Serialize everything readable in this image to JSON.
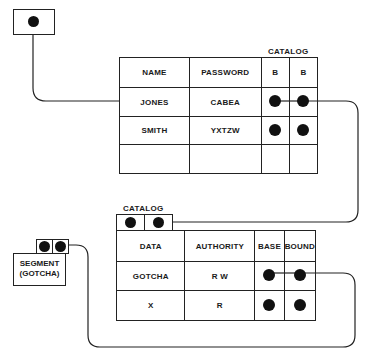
{
  "top_pointer": {
    "icon": "pointer-dot-icon"
  },
  "user_table": {
    "catalog_label": "CATALOG",
    "headers": [
      "NAME",
      "PASSWORD",
      "B",
      "B"
    ],
    "rows": [
      {
        "name": "JONES",
        "password": "CABEA",
        "b1": "dot",
        "b2": "dot"
      },
      {
        "name": "SMITH",
        "password": "YXTZW",
        "b1": "dot",
        "b2": "dot"
      },
      {
        "name": "",
        "password": "",
        "b1": "",
        "b2": ""
      }
    ]
  },
  "catalog_table": {
    "catalog_label": "CATALOG",
    "headers": [
      "DATA",
      "AUTHORITY",
      "BASE",
      "BOUND"
    ],
    "rows": [
      {
        "data": "GOTCHA",
        "authority": "R W",
        "base": "dot",
        "bound": "dot"
      },
      {
        "data": "X",
        "authority": "R",
        "base": "dot",
        "bound": "dot"
      }
    ]
  },
  "segment": {
    "line1": "SEGMENT",
    "line2": "(GOTCHA)"
  },
  "colors": {
    "ink": "#1a1a1a",
    "background": "#ffffff"
  }
}
